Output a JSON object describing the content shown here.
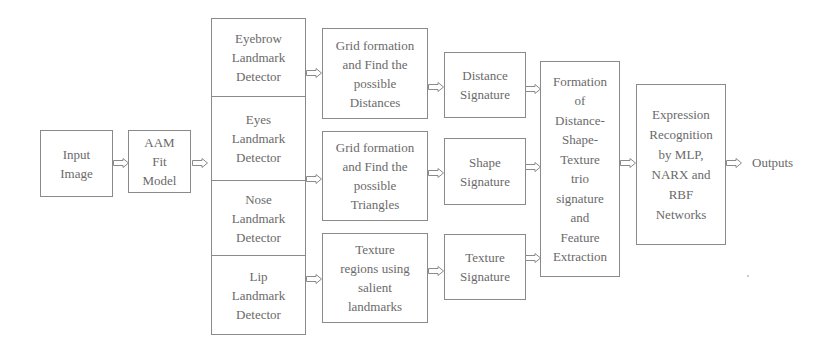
{
  "diagram": {
    "nodes": {
      "input": "Input\nImage",
      "aam": "AAM\nFit\nModel",
      "detectors": [
        "Eyebrow\nLandmark\nDetector",
        "Eyes\nLandmark\nDetector",
        "Nose\nLandmark\nDetector",
        "Lip\nLandmark\nDetector"
      ],
      "grid_distances": "Grid formation\nand Find the\npossible\nDistances",
      "grid_triangles": "Grid formation\nand Find the\npossible\nTriangles",
      "texture_regions": "Texture\nregions using\nsalient\nlandmarks",
      "distance_signature": "Distance\nSignature",
      "shape_signature": "Shape\nSignature",
      "texture_signature": "Texture\nSignature",
      "formation": "Formation\nof\nDistance-\nShape-\nTexture\ntrio\nsignature\nand\nFeature\nExtraction",
      "recognition": "Expression\nRecognition\nby MLP,\nNARX and\nRBF\nNetworks",
      "output": "Outputs"
    },
    "edges": [
      [
        "Input Image",
        "AAM Fit Model"
      ],
      [
        "AAM Fit Model",
        "Landmark Detectors"
      ],
      [
        "Eyebrow Landmark Detector",
        "Grid formation and Find the possible Distances"
      ],
      [
        "Eyes/Nose Landmark Detector",
        "Grid formation and Find the possible Triangles"
      ],
      [
        "Lip Landmark Detector",
        "Texture regions using salient landmarks"
      ],
      [
        "Grid formation and Find the possible Distances",
        "Distance Signature"
      ],
      [
        "Grid formation and Find the possible Triangles",
        "Shape Signature"
      ],
      [
        "Texture regions using salient landmarks",
        "Texture Signature"
      ],
      [
        "Distance Signature",
        "Formation of Distance-Shape-Texture trio signature and Feature Extraction"
      ],
      [
        "Shape Signature",
        "Formation of Distance-Shape-Texture trio signature and Feature Extraction"
      ],
      [
        "Texture Signature",
        "Formation of Distance-Shape-Texture trio signature and Feature Extraction"
      ],
      [
        "Formation of Distance-Shape-Texture trio signature and Feature Extraction",
        "Expression Recognition by MLP, NARX and RBF Networks"
      ],
      [
        "Expression Recognition by MLP, NARX and RBF Networks",
        "Outputs"
      ]
    ]
  }
}
